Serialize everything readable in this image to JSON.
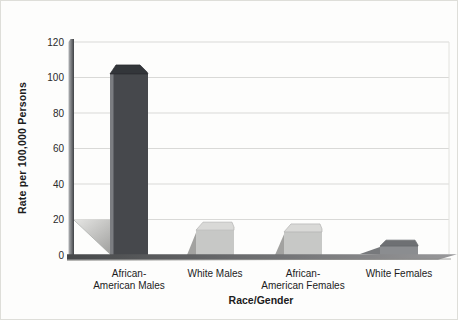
{
  "figure": {
    "background": "#fdfdfc"
  },
  "chart_data": {
    "type": "bar",
    "title": "",
    "categories": [
      "African-American Males",
      "White Males",
      "African-American Females",
      "White Females"
    ],
    "category_label_lines": [
      [
        "African-",
        "American Males"
      ],
      [
        "White Males"
      ],
      [
        "African-",
        "American Females"
      ],
      [
        "White Females"
      ]
    ],
    "values": [
      102,
      14,
      13,
      5
    ],
    "xlabel": "Race/Gender",
    "ylabel": "Rate per 100,000 Persons",
    "yticks": [
      0,
      20,
      40,
      60,
      80,
      100,
      120
    ],
    "ylim": [
      0,
      120
    ],
    "grid": "horizontal",
    "legend": "none",
    "gridline_color": "#d9d9d7",
    "plot_border_color": "#e2e2de",
    "text_color": "#1c1c1c",
    "tick_color": "#2a2a2a",
    "bar_styles": [
      {
        "kind": "dark",
        "front": "#46484c",
        "top": "#33363a",
        "edge_highlight": "#7b7d81",
        "shadow": "#c9c9c7"
      },
      {
        "kind": "light",
        "front": "#c7c8c6",
        "top": "#d9d9d7",
        "outline": "#b2b2b0",
        "shadow": "#a2a2a0"
      },
      {
        "kind": "light",
        "front": "#c7c8c6",
        "top": "#d9d9d7",
        "outline": "#b2b2b0",
        "shadow": "#a2a2a0"
      },
      {
        "kind": "medium",
        "front": "#8b8d90",
        "top": "#6e7073",
        "outline": "#636568",
        "shadow": "#77797c"
      }
    ],
    "axis_gradient": [
      "#b2b4b6",
      "#3f4145"
    ],
    "floor_gradient": [
      "#46484a",
      "#98989a"
    ],
    "floor_shadow_gradient": [
      "#e6e6e4",
      "#a4a4a2"
    ]
  }
}
